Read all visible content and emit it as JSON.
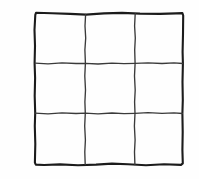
{
  "figure": {
    "panel_label": "I",
    "label_icon_name": "panel-label-letter-i",
    "background_color": "#fefefe",
    "stroke_color_outer": "#1b1b1b",
    "stroke_color_inner": "#3a3a3a",
    "style": "hand-drawn",
    "canvas": {
      "width": 199,
      "height": 179
    }
  },
  "grid": {
    "rows": 3,
    "columns": 3,
    "cell_count": 9,
    "bounds": {
      "left": 35,
      "top": 13,
      "right": 183,
      "bottom": 165
    },
    "vertical_divider_x": [
      85,
      135
    ],
    "horizontal_divider_y": [
      63,
      113
    ],
    "outer_stroke_width": 2.1,
    "inner_stroke_width": 1.35,
    "cells": [
      {
        "id": "r1c1",
        "row": 1,
        "column": 1,
        "content": ""
      },
      {
        "id": "r1c2",
        "row": 1,
        "column": 2,
        "content": ""
      },
      {
        "id": "r1c3",
        "row": 1,
        "column": 3,
        "content": ""
      },
      {
        "id": "r2c1",
        "row": 2,
        "column": 1,
        "content": ""
      },
      {
        "id": "r2c2",
        "row": 2,
        "column": 2,
        "content": ""
      },
      {
        "id": "r2c3",
        "row": 2,
        "column": 3,
        "content": ""
      },
      {
        "id": "r3c1",
        "row": 3,
        "column": 1,
        "content": ""
      },
      {
        "id": "r3c2",
        "row": 3,
        "column": 2,
        "content": ""
      },
      {
        "id": "r3c3",
        "row": 3,
        "column": 3,
        "content": ""
      }
    ],
    "paths": {
      "outer_border": "M 35.3 14.8 L 36.0 12.8 L 52 13.2 L 70 13.9 L 86 14.6 L 104 13.4 L 122 12.9 L 140 13.6 L 160 13.9 L 176 13.4 L 182.4 13.1 L 183.2 15.5 L 183.0 34 L 182.6 52 L 182.9 63.5 L 182.5 82 L 182.8 100 L 182.4 113.5 L 182.7 132 L 182.4 150 L 182.8 163.4 L 181.0 164.9 L 164 164.2 L 146 165.2 L 128 164.3 L 112 163.6 L 96 164.6 L 78 165.3 L 60 164.4 L 44 165.0 L 35.8 164.6 L 34.9 162.6 L 35.3 144 L 34.8 126 L 35.2 113.2 L 34.7 96 L 35.1 78 L 34.6 63.2 L 35.0 46 L 34.5 30 Z",
      "vertical_1": "M 85.6 14.4 L 85.0 26 L 85.7 38 L 84.9 50 L 85.4 63.3 L 84.8 76 L 85.5 90 L 84.9 102 L 85.3 113.2 L 84.7 126 L 85.4 140 L 84.8 152 L 85.2 164.6",
      "vertical_2": "M 135.2 13.7 L 134.6 26 L 135.3 38 L 134.7 50 L 135.1 63.4 L 134.5 76 L 135.2 90 L 134.6 102 L 135.0 113.3 L 134.4 126 L 135.1 140 L 134.5 152 L 134.9 164.5",
      "horizontal_1": "M 35.1 63.2 L 48 63.8 L 62 62.9 L 76 63.5 L 85.4 63.3 L 98 64.0 L 112 63.1 L 124 63.7 L 135.1 63.4 L 148 62.8 L 162 63.5 L 174 62.9 L 182.7 63.5",
      "horizontal_2": "M 34.9 113.2 L 48 113.8 L 62 112.9 L 76 113.5 L 85.3 113.2 L 98 113.9 L 112 113.0 L 124 113.6 L 135.0 113.3 L 148 112.7 L 162 113.4 L 174 112.8 L 182.4 113.5"
    }
  }
}
